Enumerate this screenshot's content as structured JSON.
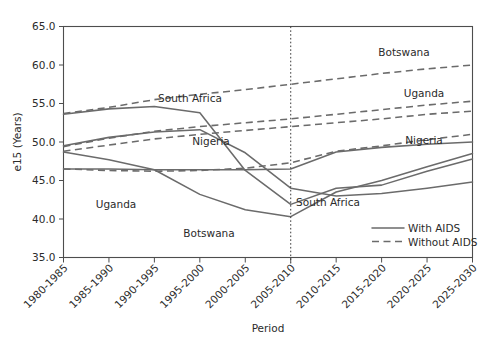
{
  "chart_data": {
    "type": "line",
    "title": "",
    "xlabel": "Period",
    "ylabel": "e15 (Years)",
    "ylim": [
      35.0,
      65.0
    ],
    "ytick_labels": [
      "35.0",
      "40.0",
      "45.0",
      "50.0",
      "55.0",
      "60.0",
      "65.0"
    ],
    "yticks": [
      35.0,
      40.0,
      45.0,
      50.0,
      55.0,
      60.0,
      65.0
    ],
    "grid": false,
    "legend_position": "bottom-right",
    "categories": [
      "1980-1985",
      "1985-1990",
      "1990-1995",
      "1995-2000",
      "2000-2005",
      "2005-2010",
      "2010-2015",
      "2015-2020",
      "2020-2025",
      "2025-2030"
    ],
    "annotations": [
      {
        "text": "Botswana",
        "x_pixel": 404,
        "y_pixel": 56
      },
      {
        "text": "South Africa",
        "x_pixel": 190,
        "y_pixel": 102
      },
      {
        "text": "Uganda",
        "x_pixel": 424,
        "y_pixel": 97
      },
      {
        "text": "Nigeria",
        "x_pixel": 211,
        "y_pixel": 145
      },
      {
        "text": "Nigeria",
        "x_pixel": 424,
        "y_pixel": 144
      },
      {
        "text": "Uganda",
        "x_pixel": 116,
        "y_pixel": 208
      },
      {
        "text": "Botswana",
        "x_pixel": 209,
        "y_pixel": 237
      },
      {
        "text": "South Africa",
        "x_pixel": 328,
        "y_pixel": 206
      }
    ],
    "series": [
      {
        "name": "Botswana With AIDS",
        "country": "Botswana",
        "scenario": "With AIDS",
        "style": "solid",
        "color": "#6b6b6b",
        "values": [
          53.6,
          54.3,
          54.6,
          53.8,
          46.3,
          41.9,
          44.0,
          44.4,
          46.2,
          47.8
        ]
      },
      {
        "name": "Botswana Without AIDS",
        "country": "Botswana",
        "scenario": "Without AIDS",
        "style": "dashed",
        "color": "#6b6b6b",
        "values": [
          53.7,
          54.5,
          55.5,
          56.2,
          56.8,
          57.5,
          58.2,
          58.9,
          59.5,
          60.0
        ]
      },
      {
        "name": "South Africa With AIDS",
        "country": "South Africa",
        "scenario": "With AIDS",
        "style": "solid",
        "color": "#6b6b6b",
        "values": [
          49.5,
          50.6,
          51.3,
          51.6,
          48.6,
          44.0,
          43.0,
          43.3,
          44.0,
          44.8
        ]
      },
      {
        "name": "South Africa Without AIDS",
        "country": "South Africa",
        "scenario": "Without AIDS",
        "style": "dashed",
        "color": "#6b6b6b",
        "values": [
          49.4,
          50.5,
          51.4,
          52.0,
          52.5,
          53.0,
          53.6,
          54.2,
          54.8,
          55.3
        ]
      },
      {
        "name": "Uganda With AIDS",
        "country": "Uganda",
        "scenario": "With AIDS",
        "style": "solid",
        "color": "#6b6b6b",
        "values": [
          48.7,
          47.7,
          46.4,
          43.2,
          41.2,
          40.3,
          43.5,
          45.0,
          46.8,
          48.5
        ]
      },
      {
        "name": "Uganda Without AIDS",
        "country": "Uganda",
        "scenario": "Without AIDS",
        "style": "dashed",
        "color": "#6b6b6b",
        "values": [
          48.8,
          49.6,
          50.4,
          51.0,
          51.5,
          52.0,
          52.5,
          53.0,
          53.6,
          54.0
        ]
      },
      {
        "name": "Nigeria With AIDS",
        "country": "Nigeria",
        "scenario": "With AIDS",
        "style": "solid",
        "color": "#6b6b6b",
        "values": [
          46.5,
          46.5,
          46.4,
          46.4,
          46.4,
          46.5,
          48.7,
          49.3,
          49.7,
          50.0
        ]
      },
      {
        "name": "Nigeria Without AIDS",
        "country": "Nigeria",
        "scenario": "Without AIDS",
        "style": "dashed",
        "color": "#6b6b6b",
        "values": [
          46.5,
          46.3,
          46.2,
          46.3,
          46.6,
          47.3,
          48.8,
          49.5,
          50.3,
          51.0
        ]
      }
    ],
    "legend": [
      {
        "label": "With AIDS",
        "style": "solid"
      },
      {
        "label": "Without AIDS",
        "style": "dashed"
      }
    ],
    "vertical_divider": {
      "after_category": "2005-2010",
      "style": "dotted"
    }
  }
}
